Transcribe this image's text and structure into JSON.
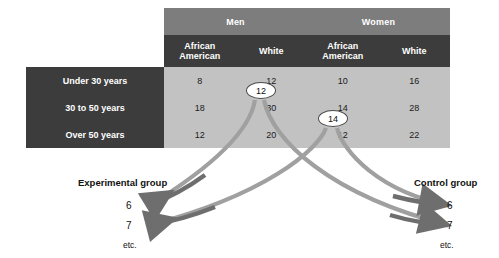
{
  "figure": {
    "background_color": "#ffffff",
    "table": {
      "corner_blank": "",
      "column_groups": [
        {
          "label": "Men",
          "subcolumns": [
            "African American",
            "White"
          ]
        },
        {
          "label": "Women",
          "subcolumns": [
            "African American",
            "White"
          ]
        }
      ],
      "subcolumn_labels": {
        "men_african_american": "African\nAmerican",
        "men_white": "White",
        "women_african_american": "African\nAmerican",
        "women_white": "White"
      },
      "row_labels": [
        "Under 30 years",
        "30 to 50 years",
        "Over 50 years"
      ],
      "rows": [
        {
          "label": "Under 30 years",
          "cells": [
            "8",
            "12",
            "10",
            "16"
          ]
        },
        {
          "label": "30 to 50 years",
          "cells": [
            "18",
            "30",
            "14",
            "28"
          ]
        },
        {
          "label": "Over 50 years",
          "cells": [
            "12",
            "20",
            "12",
            "22"
          ]
        }
      ],
      "colors": {
        "group_header_bg": "#7d7d7d",
        "sub_header_bg": "#3c3c3c",
        "row_label_bg": "#3c3c3c",
        "data_cell_bg": "#c2c2c2",
        "header_text": "#ffffff",
        "data_text": "#1a1a1a",
        "grid_line": "#ffffff"
      }
    },
    "callouts": [
      {
        "id": "cell-men-white-under30",
        "value": "12",
        "source_cell": "Men / White / Under 30 years"
      },
      {
        "id": "cell-women-aa-30to50",
        "value": "14",
        "source_cell": "Women / African American / 30 to 50 years"
      }
    ],
    "assignment": {
      "experimental": {
        "title": "Experimental group",
        "items": [
          "6",
          "7"
        ],
        "etc": "etc."
      },
      "control": {
        "title": "Control group",
        "items": [
          "6",
          "7"
        ],
        "etc": "etc."
      },
      "arrow_color_dark": "#6e6e6e",
      "arrow_color_light": "#a8a8a8"
    }
  }
}
